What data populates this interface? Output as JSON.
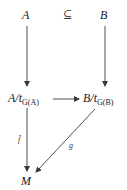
{
  "diagram": {
    "type": "commutative-diagram",
    "nodes": {
      "A": {
        "label": "A"
      },
      "B": {
        "label": "B"
      },
      "A_quot": {
        "base": "A",
        "slash": "/",
        "t": "t",
        "sub": "G(A)"
      },
      "B_quot": {
        "base": "B",
        "slash": "/",
        "t": "t",
        "sub": "G(B)"
      },
      "M": {
        "label": "M"
      }
    },
    "relation": {
      "symbol": "⊆",
      "between": [
        "A",
        "B"
      ]
    },
    "arrows": [
      {
        "from": "A",
        "to": "A_quot",
        "label": ""
      },
      {
        "from": "B",
        "to": "B_quot",
        "label": ""
      },
      {
        "from": "A_quot",
        "to": "B_quot",
        "label": ""
      },
      {
        "from": "A_quot",
        "to": "M",
        "label": "f̄"
      },
      {
        "from": "B_quot",
        "to": "M",
        "label": "g"
      }
    ],
    "colors": {
      "ink": "#1a1a1a",
      "arrow": "#3a3a3a"
    }
  }
}
